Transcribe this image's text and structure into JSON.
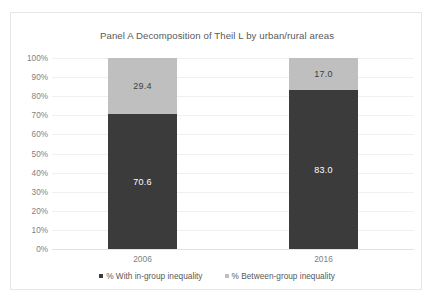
{
  "chart_data": {
    "type": "bar",
    "subtype": "100% stacked column",
    "title": "Panel A Decomposition of Theil L by urban/rural areas",
    "xlabel": "",
    "ylabel": "",
    "categories": [
      "2006",
      "2016"
    ],
    "series": [
      {
        "name": "% With in-group inequality",
        "color": "#3b3b3b",
        "values": [
          70.6,
          83.0
        ],
        "labels": [
          "70.6",
          "83.0"
        ]
      },
      {
        "name": "% Between-group inequality",
        "color": "#bfbfbf",
        "values": [
          29.4,
          17.0
        ],
        "labels": [
          "29.4",
          "17.0"
        ]
      }
    ],
    "ylim": [
      0,
      100
    ],
    "y_tick_labels": [
      "100%",
      "90%",
      "80%",
      "70%",
      "60%",
      "50%",
      "40%",
      "30%",
      "20%",
      "10%",
      "0%"
    ],
    "y_tick_values": [
      100,
      90,
      80,
      70,
      60,
      50,
      40,
      30,
      20,
      10,
      0
    ],
    "grid": true,
    "legend_position": "bottom",
    "legend": [
      {
        "label": "% With in-group inequality",
        "swatch": "dark"
      },
      {
        "label": "% Between-group inequality",
        "swatch": "light"
      }
    ]
  },
  "colors": {
    "in_group": "#3b3b3b",
    "between_group": "#bfbfbf",
    "gridline": "#f0f0f0",
    "axis_text": "#7f7f7f",
    "title_text": "#595959",
    "frame_border": "#e6e6e6",
    "background": "#ffffff"
  }
}
